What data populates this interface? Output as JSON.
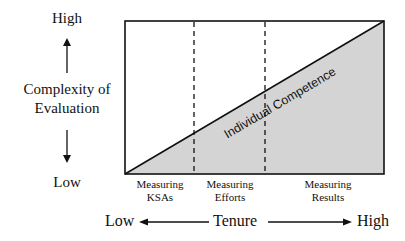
{
  "y_axis": {
    "high_label": "High",
    "title_line1": "Complexity of",
    "title_line2": "Evaluation",
    "low_label": "Low"
  },
  "x_axis": {
    "low_label": "Low",
    "title": "Tenure",
    "high_label": "High"
  },
  "diagram": {
    "diagonal_label": "Individual Competence",
    "fill_color": "#d4d4d4",
    "line_color": "#111111",
    "phases": [
      {
        "line1": "Measuring",
        "line2": "KSAs"
      },
      {
        "line1": "Measuring",
        "line2": "Efforts"
      },
      {
        "line1": "Measuring",
        "line2": "Results"
      }
    ]
  }
}
